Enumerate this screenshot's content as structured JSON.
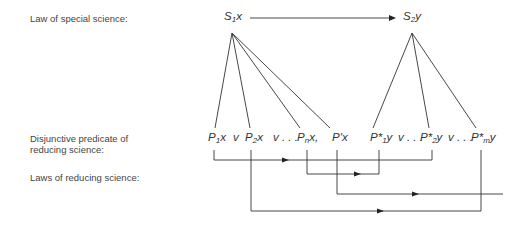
{
  "labels": {
    "law_special": "Law of special science:",
    "disjunctive_line1": "Disjunctive predicate of",
    "disjunctive_line2": "reducing science:",
    "laws_reducing": "Laws of reducing science:"
  },
  "top_terms": {
    "s1": {
      "base": "S",
      "sub": "1",
      "rest": "x"
    },
    "s2": {
      "base": "S",
      "sub": "2",
      "rest": "y"
    }
  },
  "predicates": {
    "p1": {
      "base": "P",
      "sub": "1",
      "rest": "x"
    },
    "v1": "v",
    "p2": {
      "base": "P",
      "sub": "2",
      "rest": "x"
    },
    "v2": "v . . .",
    "pn": {
      "base": "P",
      "sub": "n",
      "rest": "x,"
    },
    "pprime": {
      "base": "P'",
      "rest": "x"
    },
    "ps1": {
      "base": "P*",
      "sub": "1",
      "rest": "y"
    },
    "v3": "v . . .",
    "ps2": {
      "base": "P*",
      "sub": "2",
      "rest": "y"
    },
    "v4": "v . . .",
    "psm": {
      "base": "P*",
      "sub": "m",
      "rest": "y"
    }
  },
  "colors": {
    "line": "#333333",
    "text": "#333333",
    "label": "#444444"
  }
}
